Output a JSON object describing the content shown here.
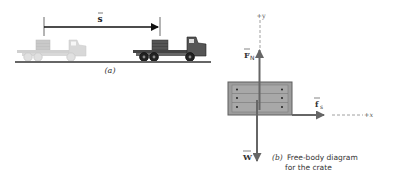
{
  "panel_a": {
    "displacement_label": "s",
    "caption": "(a)",
    "trucks": [
      {
        "state": "initial",
        "style": "faded"
      },
      {
        "state": "final",
        "style": "solid"
      }
    ]
  },
  "panel_b": {
    "axis_y_label": "+y",
    "axis_x_label": "+x",
    "force_normal_label": "F",
    "force_normal_subscript": "N",
    "force_friction_label": "f",
    "force_friction_subscript": "s",
    "weight_label": "W",
    "caption_prefix": "(b)",
    "caption_line1": "Free-body diagram",
    "caption_line2": "for the crate"
  },
  "colors": {
    "arrow": "#555555",
    "crate_fill": "#9a9a9a",
    "crate_border": "#5a5a5a",
    "ghost_truck": "#c8c8c8",
    "solid_truck": "#3a3a3a",
    "ground": "#555555",
    "text": "#333333"
  }
}
